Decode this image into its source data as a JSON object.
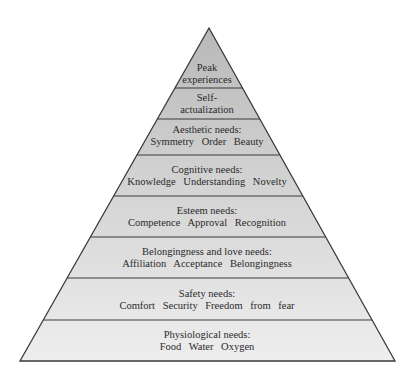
{
  "diagram": {
    "type": "pyramid",
    "apex": {
      "x": 209,
      "y": 28
    },
    "base": {
      "y": 361,
      "left_x": 20,
      "right_x": 395
    },
    "colors": {
      "top_fill": "#bdbdbd",
      "bottom_fill": "#ececec",
      "stroke": "#3a3a3a",
      "text": "#2a2a2a"
    },
    "levels": [
      {
        "id": "peak",
        "title": "Peak",
        "items": "experiences",
        "y_top": 28,
        "y_bottom": 88,
        "text_y": 62
      },
      {
        "id": "self-actualization",
        "title": "Self-",
        "items": "actualization",
        "y_top": 88,
        "y_bottom": 119,
        "text_y": 92
      },
      {
        "id": "aesthetic",
        "title": "Aesthetic needs:",
        "items": "Symmetry  Order  Beauty",
        "y_top": 119,
        "y_bottom": 155,
        "text_y": 124
      },
      {
        "id": "cognitive",
        "title": "Cognitive needs:",
        "items": "Knowledge  Understanding  Novelty",
        "y_top": 155,
        "y_bottom": 196,
        "text_y": 164
      },
      {
        "id": "esteem",
        "title": "Esteem needs:",
        "items": "Competence  Approval  Recognition",
        "y_top": 196,
        "y_bottom": 237,
        "text_y": 205
      },
      {
        "id": "belongingness",
        "title": "Belongingness and love needs:",
        "items": "Affiliation  Acceptance  Belongingness",
        "y_top": 237,
        "y_bottom": 278,
        "text_y": 246
      },
      {
        "id": "safety",
        "title": "Safety needs:",
        "items": "Comfort   Security   Freedom from fear",
        "y_top": 278,
        "y_bottom": 320,
        "text_y": 288
      },
      {
        "id": "physiological",
        "title": "Physiological needs:",
        "items": "Food   Water   Oxygen",
        "y_top": 320,
        "y_bottom": 361,
        "text_y": 329
      }
    ]
  }
}
